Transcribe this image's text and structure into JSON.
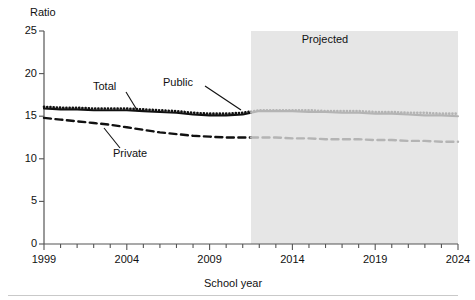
{
  "chart_data": {
    "type": "line",
    "title": "",
    "xlabel": "School year",
    "ylabel": "Ratio",
    "ylim": [
      0,
      25
    ],
    "xlim": [
      1999,
      2024
    ],
    "yticks": [
      0,
      5,
      10,
      15,
      20,
      25
    ],
    "xticks": [
      1999,
      2004,
      2009,
      2014,
      2019,
      2024
    ],
    "xtick_minor_step": 1,
    "grid": false,
    "legend_position": "inline-annotations",
    "annotations": [
      {
        "text": "Total",
        "series": "Total"
      },
      {
        "text": "Public",
        "series": "Public"
      },
      {
        "text": "Private",
        "series": "Private"
      },
      {
        "text": "Projected",
        "region": "shaded"
      }
    ],
    "projection_start_year": 2011.5,
    "x": [
      1999,
      2000,
      2001,
      2002,
      2003,
      2004,
      2005,
      2006,
      2007,
      2008,
      2009,
      2010,
      2011,
      2012,
      2013,
      2014,
      2015,
      2016,
      2017,
      2018,
      2019,
      2020,
      2021,
      2022,
      2023,
      2024
    ],
    "series": [
      {
        "name": "Public",
        "style": "dotted",
        "color": "#111111",
        "projected_color": "#b4b4b4",
        "values": [
          16.1,
          16.0,
          16.0,
          15.9,
          15.9,
          15.9,
          15.8,
          15.7,
          15.6,
          15.4,
          15.3,
          15.3,
          15.4,
          15.7,
          15.7,
          15.7,
          15.7,
          15.6,
          15.6,
          15.6,
          15.5,
          15.5,
          15.4,
          15.4,
          15.3,
          15.3
        ]
      },
      {
        "name": "Total",
        "style": "solid",
        "color": "#111111",
        "projected_color": "#b4b4b4",
        "values": [
          15.9,
          15.8,
          15.8,
          15.7,
          15.7,
          15.7,
          15.6,
          15.5,
          15.4,
          15.2,
          15.1,
          15.1,
          15.2,
          15.6,
          15.6,
          15.6,
          15.5,
          15.5,
          15.4,
          15.4,
          15.3,
          15.3,
          15.2,
          15.1,
          15.1,
          15.0
        ]
      },
      {
        "name": "Private",
        "style": "dashed",
        "color": "#111111",
        "projected_color": "#b4b4b4",
        "values": [
          14.8,
          14.6,
          14.4,
          14.2,
          14.0,
          13.7,
          13.4,
          13.1,
          12.9,
          12.7,
          12.6,
          12.5,
          12.5,
          12.5,
          12.5,
          12.4,
          12.4,
          12.3,
          12.3,
          12.3,
          12.2,
          12.2,
          12.1,
          12.1,
          12.0,
          12.0
        ]
      }
    ],
    "shaded_region": {
      "label": "Projected",
      "fill": "#e6e6e6",
      "from": 2011.5,
      "to": 2024
    }
  },
  "labels": {
    "ylabel": "Ratio",
    "xlabel": "School year",
    "projected": "Projected",
    "total": "Total",
    "public": "Public",
    "private": "Private"
  }
}
